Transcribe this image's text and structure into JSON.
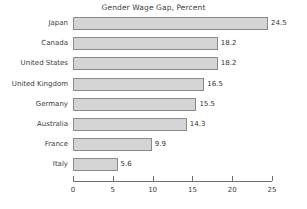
{
  "chart_data": {
    "type": "bar",
    "orientation": "horizontal",
    "title": "Gender Wage Gap, Percent",
    "xlabel": "",
    "ylabel": "",
    "xlim": [
      0,
      25
    ],
    "grid": false,
    "legend": null,
    "categories": [
      "Japan",
      "Canada",
      "United States",
      "United Kingdom",
      "Germany",
      "Australia",
      "France",
      "Italy"
    ],
    "values": [
      24.5,
      18.2,
      18.2,
      16.5,
      15.5,
      14.3,
      9.9,
      5.6
    ],
    "value_labels": [
      "24.5",
      "18.2",
      "18.2",
      "16.5",
      "15.5",
      "14.3",
      "9.9",
      "5.6"
    ],
    "xticks": [
      0,
      5,
      10,
      15,
      20,
      25
    ],
    "xtick_labels": [
      "0",
      "5",
      "10",
      "15",
      "20",
      "25"
    ],
    "colors": {
      "bar_fill": "#d4d4d4",
      "bar_border": "#8a8a8a",
      "text": "#3c3c3c",
      "axis": "#6e6e6e",
      "background": "#ffffff"
    }
  }
}
